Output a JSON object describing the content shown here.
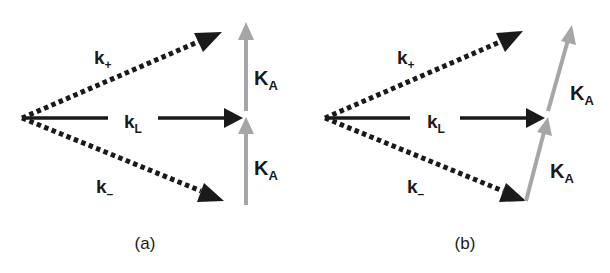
{
  "figure": {
    "panels": [
      {
        "id": "a",
        "caption": "(a)",
        "labels": {
          "k_plus": {
            "main": "k",
            "sub": "+"
          },
          "k_L": {
            "main": "k",
            "sub": "L"
          },
          "k_minus": {
            "main": "k",
            "sub": "–"
          },
          "K_A_upper": {
            "main": "K",
            "sub": "A"
          },
          "K_A_lower": {
            "main": "K",
            "sub": "A"
          }
        }
      },
      {
        "id": "b",
        "caption": "(b)",
        "labels": {
          "k_plus": {
            "main": "k",
            "sub": "+"
          },
          "k_L": {
            "main": "k",
            "sub": "L"
          },
          "k_minus": {
            "main": "k",
            "sub": "–"
          },
          "K_A_upper": {
            "main": "K",
            "sub": "A"
          },
          "K_A_lower": {
            "main": "K",
            "sub": "A"
          }
        }
      }
    ],
    "colors": {
      "wave_vector": "#1a1a1a",
      "grating_vector": "#a6a6a6"
    }
  }
}
